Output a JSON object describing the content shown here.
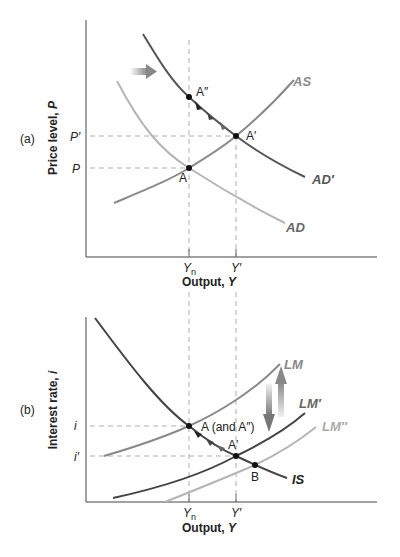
{
  "panel_a": {
    "tag": "(a)",
    "ylabel": "Price level, ",
    "ylabel_var": "P",
    "xlabel": "Output, ",
    "xlabel_var": "Y",
    "tick_y": [
      "P′",
      "P"
    ],
    "tick_x": [
      "Y",
      "n",
      "Y′"
    ],
    "curves": {
      "as": "AS",
      "ad": "AD",
      "ad_prime": "AD′"
    },
    "points": {
      "a": "A",
      "a_prime": "A′",
      "a_double": "A″"
    }
  },
  "panel_b": {
    "tag": "(b)",
    "ylabel": "Interest rate, ",
    "ylabel_var": "i",
    "xlabel": "Output, ",
    "xlabel_var": "Y",
    "tick_y": [
      "i",
      "i′"
    ],
    "tick_x": [
      "Y",
      "n",
      "Y′"
    ],
    "curves": {
      "lm": "LM",
      "lm_prime": "LM′",
      "lm_double": "LM″",
      "is": "IS"
    },
    "points": {
      "a": "A (and A″)",
      "a_prime": "A′",
      "b": "B"
    }
  },
  "colors": {
    "dark_curve": "#555555",
    "mid_curve": "#8a8a8a",
    "light_curve": "#b5b5b5",
    "guide": "#999999",
    "axis": "#444444",
    "arrow": "#888888"
  }
}
